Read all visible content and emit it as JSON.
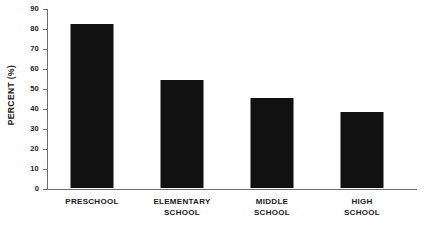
{
  "chart_data": {
    "type": "bar",
    "title": "",
    "subtitle": "",
    "xlabel": "",
    "ylabel": "PERCENT (%)",
    "categories": [
      "PRESCHOOL",
      "ELEMENTARY SCHOOL",
      "MIDDLE SCHOOL",
      "HIGH SCHOOL"
    ],
    "category_lines": [
      [
        "PRESCHOOL"
      ],
      [
        "ELEMENTARY",
        "SCHOOL"
      ],
      [
        "MIDDLE",
        "SCHOOL"
      ],
      [
        "HIGH",
        "SCHOOL"
      ]
    ],
    "values": [
      82,
      54,
      45,
      38
    ],
    "ylim": [
      0,
      90
    ],
    "ytick_step": 10,
    "yticks": [
      0,
      10,
      20,
      30,
      40,
      50,
      60,
      70,
      80,
      90
    ],
    "ytick_labels": [
      "0",
      "10",
      "20",
      "30",
      "40",
      "50",
      "60",
      "70",
      "80",
      "90"
    ],
    "grid": false,
    "legend": null,
    "bar_color": "#111111",
    "axis_color": "#6e6e6e",
    "background": "#ffffff"
  },
  "axis": {
    "y_title": "PERCENT (%)"
  }
}
